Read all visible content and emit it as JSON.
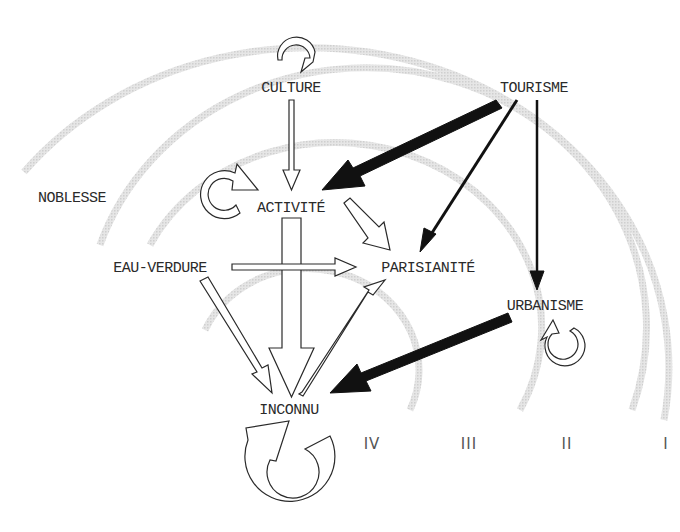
{
  "diagram": {
    "nodes": [
      {
        "id": "culture",
        "label": "CULTURE",
        "x": 291,
        "y": 88,
        "self_loop": true
      },
      {
        "id": "tourisme",
        "label": "TOURISME",
        "x": 534,
        "y": 88,
        "self_loop": false
      },
      {
        "id": "noblesse",
        "label": "NOBLESSE",
        "x": 72,
        "y": 198,
        "self_loop": false
      },
      {
        "id": "activite",
        "label": "ACTIVITÉ",
        "x": 291,
        "y": 208,
        "self_loop": true
      },
      {
        "id": "eau_verdure",
        "label": "EAU-VERDURE",
        "x": 160,
        "y": 268,
        "self_loop": false
      },
      {
        "id": "parisianite",
        "label": "PARISIANITÉ",
        "x": 428,
        "y": 268,
        "self_loop": false
      },
      {
        "id": "urbanisme",
        "label": "URBANISME",
        "x": 545,
        "y": 306,
        "self_loop": true
      },
      {
        "id": "inconnu",
        "label": "INCONNU",
        "x": 289,
        "y": 410,
        "self_loop": true
      }
    ],
    "edges": [
      {
        "from": "culture",
        "to": "activite",
        "style": "hollow-thin"
      },
      {
        "from": "tourisme",
        "to": "activite",
        "style": "solid-thick"
      },
      {
        "from": "tourisme",
        "to": "parisianite",
        "style": "solid-thin"
      },
      {
        "from": "tourisme",
        "to": "urbanisme",
        "style": "solid-thin"
      },
      {
        "from": "activite",
        "to": "parisianite",
        "style": "hollow-medium"
      },
      {
        "from": "activite",
        "to": "inconnu",
        "style": "hollow-thick"
      },
      {
        "from": "eau_verdure",
        "to": "parisianite",
        "style": "hollow-medium"
      },
      {
        "from": "eau_verdure",
        "to": "inconnu",
        "style": "hollow-medium"
      },
      {
        "from": "inconnu",
        "to": "parisianite",
        "style": "hollow-thin"
      },
      {
        "from": "urbanisme",
        "to": "inconnu",
        "style": "solid-thick"
      }
    ],
    "zones": [
      {
        "label": "IV",
        "x": 372,
        "y": 444
      },
      {
        "label": "III",
        "x": 469,
        "y": 444
      },
      {
        "label": "II",
        "x": 567,
        "y": 444
      },
      {
        "label": "I",
        "x": 666,
        "y": 444
      }
    ],
    "colors": {
      "ink": "#2a2a2a",
      "arc": "#dcdcdc",
      "fill": "#ffffff"
    }
  }
}
